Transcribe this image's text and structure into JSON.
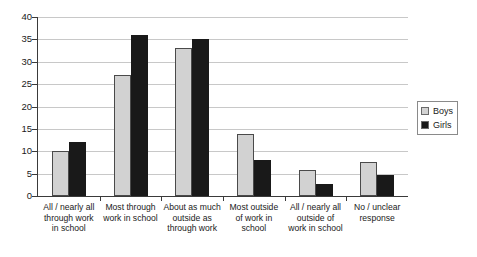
{
  "chart_data": {
    "type": "bar",
    "title": "",
    "xlabel": "",
    "ylabel": "",
    "ylim": [
      0,
      40
    ],
    "ytick_values": [
      0,
      5,
      10,
      15,
      20,
      25,
      30,
      35,
      40
    ],
    "ytick_labels": [
      "0",
      "5",
      "10",
      "15",
      "20",
      "25",
      "30",
      "35",
      "40"
    ],
    "grid": "horizontal",
    "legend_position": "right",
    "categories": [
      "All / nearly all through work in school",
      "Most through work in school",
      "About as much outside as through work",
      "Most outside of work in school",
      "All / nearly all outside of work in school",
      "No / unclear response"
    ],
    "category_lines": [
      [
        "All / nearly all",
        "through work",
        "in school"
      ],
      [
        "Most through",
        "work in school"
      ],
      [
        "About as much",
        "outside as",
        "through work"
      ],
      [
        "Most outside",
        "of work in",
        "school"
      ],
      [
        "All / nearly all",
        "outside of",
        "work in school"
      ],
      [
        "No / unclear",
        "response"
      ]
    ],
    "series": [
      {
        "name": "Boys",
        "color": "#d2d2d2",
        "values": [
          10,
          27,
          33,
          13.8,
          5.8,
          7.7
        ]
      },
      {
        "name": "Girls",
        "color": "#191919",
        "values": [
          12,
          36,
          35,
          8,
          2.7,
          4.6
        ]
      }
    ]
  },
  "legend": {
    "items": [
      {
        "label": "Boys"
      },
      {
        "label": "Girls"
      }
    ]
  }
}
